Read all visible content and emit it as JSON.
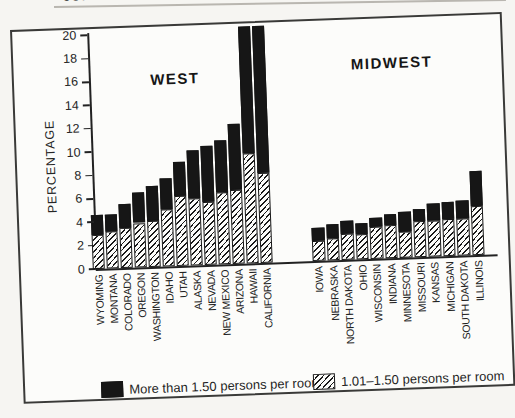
{
  "page": {
    "cropped_header_fragment": "JUHY OF IHI",
    "paper_color": "#f6f5f2",
    "bar_black_color": "#161616"
  },
  "chart_data": {
    "type": "bar",
    "stacked": true,
    "title": "",
    "ylabel": "PERCENTAGE",
    "xlabel": "",
    "ylim": [
      0,
      20
    ],
    "ytick_step": 2,
    "yticks": [
      "0",
      "2",
      "4",
      "6",
      "8",
      "10",
      "12",
      "14",
      "16",
      "18",
      "20"
    ],
    "grid": false,
    "legend_position": "bottom",
    "legend": [
      {
        "label": "More than 1.50 persons per room",
        "style": "solid-black",
        "color": "#161616"
      },
      {
        "label": "1.01–1.50 persons per room",
        "style": "diagonal-hatch"
      }
    ],
    "groups": [
      {
        "title": "WEST",
        "categories": [
          "WYOMING",
          "MONTANA",
          "COLORADO",
          "OREGON",
          "WASHINGTON",
          "IDAHO",
          "UTAH",
          "ALASKA",
          "NEVADA",
          "NEW MEXICO",
          "ARIZONA",
          "HAWAII",
          "CALIFORNIA"
        ],
        "series": [
          {
            "name": "1.01–1.50 persons per room",
            "values": [
              2.9,
              3.2,
              3.4,
              3.8,
              3.9,
              4.9,
              6.0,
              5.7,
              5.4,
              6.2,
              6.3,
              9.4,
              7.7
            ]
          },
          {
            "name": "More than 1.50 persons per room",
            "values": [
              1.7,
              1.4,
              2.1,
              2.6,
              3.0,
              2.6,
              2.9,
              4.1,
              4.8,
              4.4,
              5.7,
              10.9,
              12.6
            ]
          }
        ],
        "totals": [
          4.6,
          4.6,
          5.5,
          6.4,
          6.9,
          7.5,
          8.9,
          9.8,
          10.2,
          10.6,
          12.0,
          20.3,
          20.3
        ],
        "clipped_at_top": [
          "HAWAII",
          "CALIFORNIA"
        ]
      },
      {
        "title": "MIDWEST",
        "categories": [
          "IOWA",
          "NEBRASKA",
          "NORTH DAKOTA",
          "OHIO",
          "WISCONSIN",
          "INDIANA",
          "MINNESOTA",
          "MISSOURI",
          "KANSAS",
          "MICHIGAN",
          "SOUTH DAKOTA",
          "ILLINOIS"
        ],
        "series": [
          {
            "name": "1.01–1.50 persons per room",
            "values": [
              1.7,
              1.9,
              2.2,
              2.1,
              2.7,
              2.8,
              2.2,
              3.1,
              3.1,
              3.2,
              3.2,
              4.2
            ]
          },
          {
            "name": "More than 1.50 persons per room",
            "values": [
              1.1,
              1.2,
              1.1,
              1.0,
              0.8,
              1.0,
              1.7,
              1.0,
              1.4,
              1.4,
              1.5,
              3.0
            ]
          }
        ],
        "totals": [
          2.8,
          3.1,
          3.3,
          3.1,
          3.5,
          3.8,
          3.9,
          4.1,
          4.5,
          4.6,
          4.7,
          7.2
        ],
        "clipped_at_top": []
      }
    ]
  }
}
